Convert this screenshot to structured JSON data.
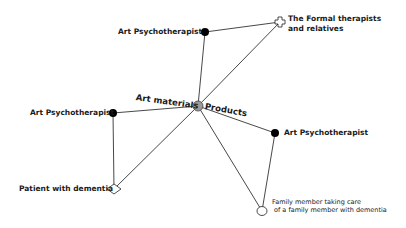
{
  "diagram": {
    "type": "network",
    "hub": {
      "id": "hub",
      "label_left": "Art materials",
      "label_right": "Products",
      "shape": "circle",
      "fill": "#9a9a9a",
      "x": 198,
      "y": 106
    },
    "nodes": [
      {
        "id": "ap_top",
        "label": "Art Psychotherapist",
        "shape": "dot",
        "fill": "#000000",
        "x": 205,
        "y": 32
      },
      {
        "id": "formal",
        "label_lines": [
          "The Formal therapists",
          "and relatives"
        ],
        "shape": "cross",
        "fill": "#ffffff",
        "x": 280,
        "y": 22
      },
      {
        "id": "ap_left",
        "label": "Art Psychotherapist",
        "shape": "dot",
        "fill": "#000000",
        "x": 113,
        "y": 113
      },
      {
        "id": "ap_right",
        "label": "Art Psychotherapist",
        "shape": "dot",
        "fill": "#000000",
        "x": 275,
        "y": 133
      },
      {
        "id": "patient",
        "label": "Patient with dementia",
        "shape": "diamond",
        "fill": "#ffffff",
        "x": 114,
        "y": 189
      },
      {
        "id": "family",
        "label_lines": [
          "Family member taking care",
          "of a family member with dementia"
        ],
        "shape": "circle",
        "fill": "#ffffff",
        "x": 262,
        "y": 211
      }
    ],
    "edges": [
      [
        "hub",
        "ap_top"
      ],
      [
        "hub",
        "formal"
      ],
      [
        "ap_top",
        "formal"
      ],
      [
        "hub",
        "ap_left"
      ],
      [
        "hub",
        "ap_right"
      ],
      [
        "hub",
        "patient"
      ],
      [
        "hub",
        "family"
      ],
      [
        "ap_left",
        "patient"
      ],
      [
        "ap_right",
        "family"
      ]
    ],
    "colors": {
      "edge": "#333333",
      "node_stroke": "#222222"
    }
  },
  "labels": {
    "ap_top": "Art Psychotherapist",
    "formal_1": "The Formal therapists",
    "formal_2": "and relatives",
    "ap_left": "Art Psychotherapist",
    "ap_right": "Art Psychotherapist",
    "patient": "Patient with dementia",
    "family_1": "Family member taking care",
    "family_2": "of a family member with dementia",
    "hub_left": "Art materials",
    "hub_right": "Products"
  }
}
